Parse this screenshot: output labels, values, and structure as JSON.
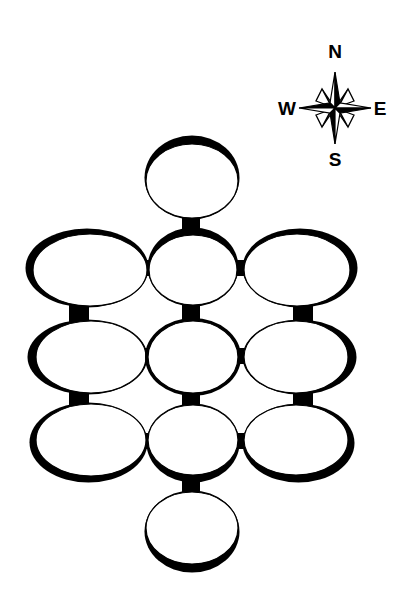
{
  "diagram": {
    "type": "dungeon-room-map",
    "background": "#ffffff",
    "ink": "#000000",
    "compass": {
      "labels": {
        "north": "N",
        "south": "S",
        "east": "E",
        "west": "W"
      },
      "center": [
        335,
        108
      ]
    },
    "rooms": [
      {
        "id": "top",
        "cx": 192,
        "cy": 181,
        "rx": 46,
        "ry": 37,
        "shadow": [
          0,
          -7
        ]
      },
      {
        "id": "row1-left",
        "cx": 90,
        "cy": 270,
        "rx": 57,
        "ry": 36,
        "shadow": [
          -6,
          -4
        ]
      },
      {
        "id": "row1-middle",
        "cx": 193,
        "cy": 270,
        "rx": 44,
        "ry": 35,
        "shadow": [
          0,
          -6
        ]
      },
      {
        "id": "row1-right",
        "cx": 297,
        "cy": 270,
        "rx": 53,
        "ry": 36,
        "shadow": [
          6,
          -4
        ]
      },
      {
        "id": "row2-left",
        "cx": 91,
        "cy": 357,
        "rx": 55,
        "ry": 36,
        "shadow": [
          -7,
          0
        ]
      },
      {
        "id": "row2-middle",
        "cx": 193,
        "cy": 357,
        "rx": 45,
        "ry": 36,
        "shadow": [
          0,
          0
        ]
      },
      {
        "id": "row2-right",
        "cx": 296,
        "cy": 357,
        "rx": 52,
        "ry": 36,
        "shadow": [
          7,
          0
        ]
      },
      {
        "id": "row3-left",
        "cx": 91,
        "cy": 440,
        "rx": 55,
        "ry": 36,
        "shadow": [
          -5,
          5
        ]
      },
      {
        "id": "row3-middle",
        "cx": 193,
        "cy": 440,
        "rx": 45,
        "ry": 35,
        "shadow": [
          0,
          6
        ]
      },
      {
        "id": "row3-right",
        "cx": 296,
        "cy": 440,
        "rx": 52,
        "ry": 35,
        "shadow": [
          5,
          6
        ]
      },
      {
        "id": "bottom",
        "cx": 192,
        "cy": 528,
        "rx": 46,
        "ry": 36,
        "shadow": [
          0,
          7
        ]
      }
    ],
    "corridors": [
      {
        "id": "top-to-row1-middle",
        "x": 182,
        "y": 214,
        "w": 18,
        "h": 24
      },
      {
        "id": "row1-left-to-row1-middle",
        "x": 143,
        "y": 260,
        "w": 10,
        "h": 16
      },
      {
        "id": "row1-middle-to-row1-right",
        "x": 234,
        "y": 260,
        "w": 14,
        "h": 16
      },
      {
        "id": "row1-left-to-row2-left",
        "x": 69,
        "y": 303,
        "w": 20,
        "h": 20
      },
      {
        "id": "row1-middle-to-row2-middle",
        "x": 182,
        "y": 302,
        "w": 18,
        "h": 20
      },
      {
        "id": "row1-right-to-row2-right",
        "x": 293,
        "y": 303,
        "w": 20,
        "h": 20
      },
      {
        "id": "row2-left-to-row2-middle",
        "x": 143,
        "y": 348,
        "w": 10,
        "h": 16
      },
      {
        "id": "row2-middle-to-row2-right",
        "x": 235,
        "y": 348,
        "w": 12,
        "h": 16
      },
      {
        "id": "row2-left-to-row3-left",
        "x": 69,
        "y": 390,
        "w": 20,
        "h": 18
      },
      {
        "id": "row2-middle-to-row3-middle",
        "x": 182,
        "y": 390,
        "w": 18,
        "h": 18
      },
      {
        "id": "row2-right-to-row3-right",
        "x": 293,
        "y": 390,
        "w": 20,
        "h": 18
      },
      {
        "id": "row3-left-to-row3-middle",
        "x": 143,
        "y": 433,
        "w": 10,
        "h": 16
      },
      {
        "id": "row3-middle-to-row3-right",
        "x": 235,
        "y": 433,
        "w": 12,
        "h": 16
      },
      {
        "id": "row3-middle-to-bottom",
        "x": 182,
        "y": 474,
        "w": 18,
        "h": 22
      }
    ]
  }
}
